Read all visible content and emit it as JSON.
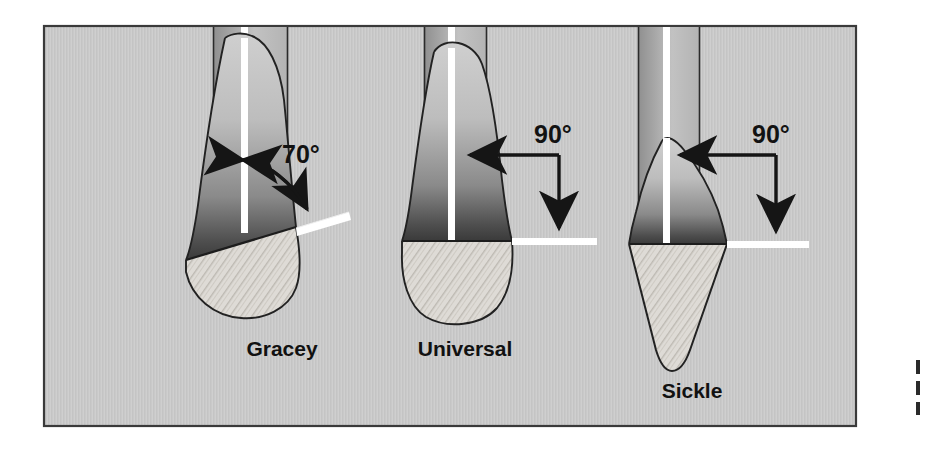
{
  "figure": {
    "frame": {
      "background_color": "#c9c9c9",
      "border_color": "#3a3a3a",
      "x": 44,
      "y": 26,
      "width": 812,
      "height": 400
    },
    "page_background": "#ffffff",
    "ink_color": "#1b1b1b",
    "highlight_color": "#ffffff"
  },
  "instruments": [
    {
      "id": "gracey",
      "label": "Gracey",
      "label_x": 282,
      "label_y": 355,
      "angle_label": "70°",
      "angle_value": 70,
      "angle_label_x": 282,
      "angle_label_y": 156,
      "arrow_style": "curved-double-headed",
      "face_orientation": "offset-tilted",
      "blade_shape": "rounded-toe-curette",
      "shank_center_x": 245,
      "shank_left_x": 213,
      "shank_right_x": 288,
      "blade_tip_y": 310,
      "description": "Offset blade, face tilted 70 degrees to terminal shank, one cutting edge"
    },
    {
      "id": "universal",
      "label": "Universal",
      "label_x": 465,
      "label_y": 355,
      "angle_label": "90°",
      "angle_value": 90,
      "angle_label_x": 533,
      "angle_label_y": 142,
      "arrow_style": "right-angle-double-headed",
      "face_orientation": "perpendicular-flat",
      "blade_shape": "rounded-toe-curette",
      "shank_center_x": 452,
      "shank_left_x": 424,
      "shank_right_x": 487,
      "blade_tip_y": 312,
      "description": "Blade face perpendicular at 90 degrees to terminal shank, two cutting edges"
    },
    {
      "id": "sickle",
      "label": "Sickle",
      "label_x": 692,
      "label_y": 397,
      "angle_label": "90°",
      "angle_value": 90,
      "angle_label_x": 752,
      "angle_label_y": 142,
      "arrow_style": "right-angle-double-headed",
      "face_orientation": "perpendicular-flat",
      "blade_shape": "pointed-triangular-sickle",
      "shank_center_x": 667,
      "shank_left_x": 638,
      "shank_right_x": 700,
      "blade_tip_y": 372,
      "description": "Triangular cross-section blade, face at 90 degrees to terminal shank, pointed tip"
    }
  ],
  "edge_fragments": [
    {
      "x": 916,
      "y": 360,
      "height": 14
    },
    {
      "x": 916,
      "y": 381,
      "height": 14
    },
    {
      "x": 916,
      "y": 402,
      "height": 13
    }
  ]
}
